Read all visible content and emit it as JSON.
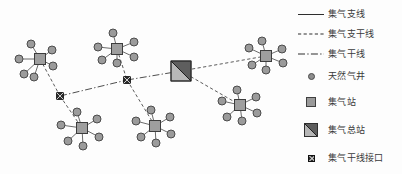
{
  "figure": {
    "kind": "natural-gas-gathering-network-diagram",
    "background_color": "#ffffff"
  },
  "legend": {
    "items": [
      {
        "symbol": "solid-line",
        "label": "集气支线"
      },
      {
        "symbol": "dashed-line",
        "label": "集气支干线"
      },
      {
        "symbol": "dash-dot-line",
        "label": "集气干线"
      },
      {
        "symbol": "circle-marker",
        "label": "天然气井"
      },
      {
        "symbol": "square-marker",
        "label": "集气站"
      },
      {
        "symbol": "split-square-marker",
        "label": "集气总站"
      },
      {
        "symbol": "hatched-square-marker",
        "label": "集气干线接口"
      }
    ]
  },
  "colors": {
    "well_fill": "#9b9b9b",
    "well_stroke": "#4c4c4c",
    "station_fill": "#9e9e9e",
    "station_stroke": "#3d3d3d",
    "main_station_light": "#b8b8b8",
    "main_station_dark": "#5e5e5e",
    "interface_fill": "#2b2b2b",
    "line_color": "#4a4a4a",
    "text_color": "#3a3a3a"
  },
  "network": {
    "gathering_stations": [
      {
        "id": "GS1",
        "x": 40,
        "y": 59,
        "size": 11,
        "wells": 6
      },
      {
        "id": "GS2",
        "x": 117,
        "y": 49,
        "size": 11,
        "wells": 6
      },
      {
        "id": "GS3",
        "x": 266,
        "y": 56,
        "size": 11,
        "wells": 6
      },
      {
        "id": "GS4",
        "x": 82,
        "y": 128,
        "size": 11,
        "wells": 6
      },
      {
        "id": "GS5",
        "x": 155,
        "y": 126,
        "size": 11,
        "wells": 6
      },
      {
        "id": "GS6",
        "x": 240,
        "y": 105,
        "size": 11,
        "wells": 6
      }
    ],
    "main_station": {
      "id": "MS1",
      "x": 181,
      "y": 71,
      "size": 20
    },
    "interfaces": [
      {
        "id": "IF1",
        "x": 60,
        "y": 96,
        "size": 7
      },
      {
        "id": "IF2",
        "x": 127,
        "y": 80,
        "size": 7
      }
    ],
    "wells": [
      {
        "station": "GS1",
        "x": 31,
        "y": 44
      },
      {
        "station": "GS1",
        "x": 19,
        "y": 59
      },
      {
        "station": "GS1",
        "x": 24,
        "y": 74
      },
      {
        "station": "GS1",
        "x": 34,
        "y": 77
      },
      {
        "station": "GS1",
        "x": 53,
        "y": 66
      },
      {
        "station": "GS1",
        "x": 52,
        "y": 50
      },
      {
        "station": "GS2",
        "x": 113,
        "y": 33
      },
      {
        "station": "GS2",
        "x": 98,
        "y": 47
      },
      {
        "station": "GS2",
        "x": 102,
        "y": 60
      },
      {
        "station": "GS2",
        "x": 117,
        "y": 63
      },
      {
        "station": "GS2",
        "x": 134,
        "y": 57
      },
      {
        "station": "GS2",
        "x": 134,
        "y": 42
      },
      {
        "station": "GS3",
        "x": 262,
        "y": 41
      },
      {
        "station": "GS3",
        "x": 249,
        "y": 48
      },
      {
        "station": "GS3",
        "x": 252,
        "y": 65
      },
      {
        "station": "GS3",
        "x": 266,
        "y": 70
      },
      {
        "station": "GS3",
        "x": 283,
        "y": 63
      },
      {
        "station": "GS3",
        "x": 282,
        "y": 49
      },
      {
        "station": "GS4",
        "x": 77,
        "y": 112
      },
      {
        "station": "GS4",
        "x": 61,
        "y": 125
      },
      {
        "station": "GS4",
        "x": 68,
        "y": 141
      },
      {
        "station": "GS4",
        "x": 83,
        "y": 146
      },
      {
        "station": "GS4",
        "x": 99,
        "y": 137
      },
      {
        "station": "GS4",
        "x": 97,
        "y": 119
      },
      {
        "station": "GS5",
        "x": 151,
        "y": 110
      },
      {
        "station": "GS5",
        "x": 136,
        "y": 121
      },
      {
        "station": "GS5",
        "x": 141,
        "y": 137
      },
      {
        "station": "GS5",
        "x": 156,
        "y": 143
      },
      {
        "station": "GS5",
        "x": 171,
        "y": 134
      },
      {
        "station": "GS5",
        "x": 170,
        "y": 117
      },
      {
        "station": "GS6",
        "x": 237,
        "y": 90
      },
      {
        "station": "GS6",
        "x": 222,
        "y": 101
      },
      {
        "station": "GS6",
        "x": 227,
        "y": 117
      },
      {
        "station": "GS6",
        "x": 242,
        "y": 121
      },
      {
        "station": "GS6",
        "x": 257,
        "y": 113
      },
      {
        "station": "GS6",
        "x": 256,
        "y": 97
      }
    ],
    "branch_links": [
      {
        "from": "GS1",
        "to": "IF1"
      },
      {
        "from": "IF1",
        "to": "GS4"
      },
      {
        "from": "GS2",
        "to": "IF2"
      },
      {
        "from": "IF2",
        "to": "GS5"
      },
      {
        "from": "MS1",
        "to": "GS3"
      },
      {
        "from": "MS1",
        "to": "GS6"
      }
    ],
    "trunk_links": [
      {
        "from": "IF1",
        "to": "IF2"
      },
      {
        "from": "IF2",
        "to": "MS1"
      }
    ]
  }
}
